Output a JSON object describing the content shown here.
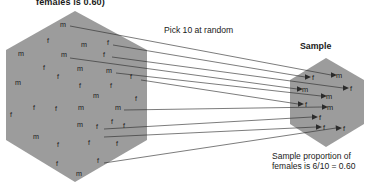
{
  "figure": {
    "title_clipped": "females is 0.60)",
    "pick_label": "Pick 10 at random",
    "sample_label": "Sample",
    "caption_line1": "Sample proportion of",
    "caption_line2": "females is 6/10 = 0.60",
    "colors": {
      "hexagon_fill": "#9c9c9c",
      "text": "#1a1a1a",
      "arrow": "#2b2b2b",
      "background": "#ffffff"
    }
  },
  "chart_data": {
    "type": "diagram",
    "title": "females is 0.60)",
    "annotations": [
      "females is 0.60)",
      "Pick 10 at random",
      "Sample",
      "Sample proportion of",
      "females is 6/10 = 0.60"
    ],
    "population": {
      "label": "",
      "shape": "hexagon",
      "proportion_females": 0.6,
      "count_m": 18,
      "count_f": 27,
      "members": [
        {
          "label": "m",
          "x": 63,
          "y": 27
        },
        {
          "label": "f",
          "x": 48,
          "y": 43
        },
        {
          "label": "m",
          "x": 84,
          "y": 47
        },
        {
          "label": "f",
          "x": 108,
          "y": 45
        },
        {
          "label": "m",
          "x": 21,
          "y": 56
        },
        {
          "label": "m",
          "x": 64,
          "y": 57
        },
        {
          "label": "f",
          "x": 104,
          "y": 57
        },
        {
          "label": "f",
          "x": 44,
          "y": 70
        },
        {
          "label": "m",
          "x": 80,
          "y": 71
        },
        {
          "label": "m",
          "x": 109,
          "y": 73
        },
        {
          "label": "m",
          "x": 18,
          "y": 85
        },
        {
          "label": "f",
          "x": 58,
          "y": 79
        },
        {
          "label": "f",
          "x": 131,
          "y": 79
        },
        {
          "label": "f",
          "x": 80,
          "y": 88
        },
        {
          "label": "f",
          "x": 111,
          "y": 88
        },
        {
          "label": "m",
          "x": 96,
          "y": 98
        },
        {
          "label": "f",
          "x": 136,
          "y": 101
        },
        {
          "label": "f",
          "x": 34,
          "y": 110
        },
        {
          "label": "f",
          "x": 56,
          "y": 111
        },
        {
          "label": "m",
          "x": 81,
          "y": 110
        },
        {
          "label": "m",
          "x": 118,
          "y": 110
        },
        {
          "label": "f",
          "x": 11,
          "y": 117
        },
        {
          "label": "m",
          "x": 80,
          "y": 127
        },
        {
          "label": "f",
          "x": 97,
          "y": 129
        },
        {
          "label": "f",
          "x": 112,
          "y": 124
        },
        {
          "label": "f",
          "x": 124,
          "y": 128
        },
        {
          "label": "m",
          "x": 36,
          "y": 139
        },
        {
          "label": "f",
          "x": 58,
          "y": 147
        },
        {
          "label": "f",
          "x": 89,
          "y": 145
        },
        {
          "label": "f",
          "x": 117,
          "y": 146
        },
        {
          "label": "f",
          "x": 57,
          "y": 166
        },
        {
          "label": "f",
          "x": 98,
          "y": 163
        },
        {
          "label": "m",
          "x": 79,
          "y": 176
        }
      ]
    },
    "sample": {
      "label": "Sample",
      "shape": "hexagon",
      "size": 10,
      "count_m": 4,
      "count_f": 6,
      "proportion_females": 0.6,
      "members": [
        {
          "label": "m",
          "x": 339,
          "y": 78
        },
        {
          "label": "f",
          "x": 313,
          "y": 80
        },
        {
          "label": "f",
          "x": 351,
          "y": 91
        },
        {
          "label": "m",
          "x": 305,
          "y": 92
        },
        {
          "label": "m",
          "x": 329,
          "y": 99
        },
        {
          "label": "f",
          "x": 306,
          "y": 107
        },
        {
          "label": "m",
          "x": 330,
          "y": 110
        },
        {
          "label": "f",
          "x": 320,
          "y": 120
        },
        {
          "label": "f",
          "x": 324,
          "y": 130
        },
        {
          "label": "f",
          "x": 344,
          "y": 131
        }
      ]
    },
    "arrows": [
      {
        "from": [
          70,
          26
        ],
        "to": [
          336,
          75
        ]
      },
      {
        "from": [
          113,
          45
        ],
        "to": [
          310,
          77
        ]
      },
      {
        "from": [
          112,
          57
        ],
        "to": [
          348,
          88
        ]
      },
      {
        "from": [
          70,
          58
        ],
        "to": [
          302,
          89
        ]
      },
      {
        "from": [
          116,
          73
        ],
        "to": [
          326,
          96
        ]
      },
      {
        "from": [
          141,
          80
        ],
        "to": [
          303,
          104
        ]
      },
      {
        "from": [
          124,
          110
        ],
        "to": [
          327,
          107
        ]
      },
      {
        "from": [
          104,
          129
        ],
        "to": [
          317,
          117
        ]
      },
      {
        "from": [
          104,
          137
        ],
        "to": [
          321,
          127
        ]
      },
      {
        "from": [
          104,
          163
        ],
        "to": [
          341,
          128
        ]
      }
    ]
  }
}
